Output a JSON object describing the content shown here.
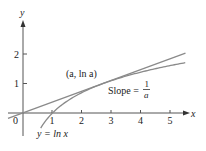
{
  "figure": {
    "axes": {
      "x_label": "x",
      "y_label": "y",
      "origin_label": "0",
      "x_ticks": [
        "1",
        "2",
        "3",
        "4",
        "5"
      ],
      "y_ticks": [
        "1",
        "2"
      ]
    },
    "curve_label": "y = ln x",
    "point_label": "(a, ln a)",
    "slope_label": "Slope =",
    "slope_fraction": {
      "numerator": "1",
      "denominator": "a"
    },
    "colors": {
      "axis": "#555555",
      "curve": "#8a8a8a",
      "tangent": "#8a8a8a",
      "text": "#222222"
    }
  },
  "chart_data": {
    "type": "line",
    "title": "",
    "xlabel": "x",
    "ylabel": "y",
    "xlim": [
      -0.6,
      5.6
    ],
    "ylim": [
      -0.4,
      2.7
    ],
    "grid": false,
    "series": [
      {
        "name": "y = ln x",
        "function": "ln(x)",
        "x_range": [
          0.6,
          5.5
        ]
      },
      {
        "name": "tangent at a = e",
        "function": "x / e",
        "slope": "1/a",
        "x_range": [
          -0.5,
          5.5
        ]
      }
    ],
    "annotations": [
      {
        "text": "(a, ln a)",
        "at": [
          2.718,
          1
        ]
      },
      {
        "text": "Slope = 1/a"
      },
      {
        "text": "y = ln x"
      }
    ]
  }
}
